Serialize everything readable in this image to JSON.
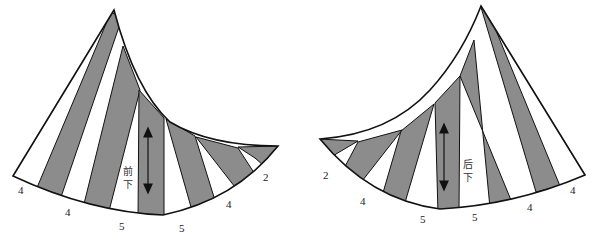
{
  "diagram": {
    "type": "sewing-pattern",
    "colors": {
      "stripe": "#8c8c8c",
      "outline": "#111111",
      "background": "#ffffff"
    },
    "front_piece": {
      "label_line1": "前",
      "label_line2": "下",
      "grain_arrow": "double-vertical-arrow",
      "edge_measurements": [
        "4",
        "4",
        "5",
        "5",
        "4",
        "2"
      ]
    },
    "back_piece": {
      "label_line1": "后",
      "label_line2": "下",
      "grain_arrow": "double-vertical-arrow",
      "edge_measurements": [
        "2",
        "4",
        "5",
        "5",
        "4",
        "4"
      ]
    }
  }
}
